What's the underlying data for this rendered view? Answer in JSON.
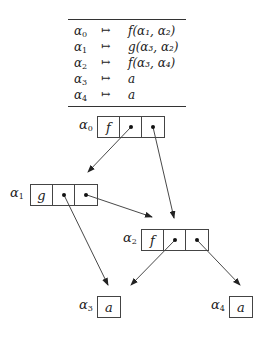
{
  "table": {
    "rows": [
      {
        "lhs": "α",
        "lhs_sub": "0",
        "arrow": "↦",
        "rhs": "f(α₁, α₂)"
      },
      {
        "lhs": "α",
        "lhs_sub": "1",
        "arrow": "↦",
        "rhs": "g(α₃, α₂)"
      },
      {
        "lhs": "α",
        "lhs_sub": "2",
        "arrow": "↦",
        "rhs": "f(α₃, α₄)"
      },
      {
        "lhs": "α",
        "lhs_sub": "3",
        "arrow": "↦",
        "rhs": "a"
      },
      {
        "lhs": "α",
        "lhs_sub": "4",
        "arrow": "↦",
        "rhs": "a"
      }
    ]
  },
  "nodes": {
    "n0": {
      "label": "α",
      "sub": "0",
      "symbol": "f"
    },
    "n1": {
      "label": "α",
      "sub": "1",
      "symbol": "g"
    },
    "n2": {
      "label": "α",
      "sub": "2",
      "symbol": "f"
    },
    "n3": {
      "label": "α",
      "sub": "3",
      "symbol": "a"
    },
    "n4": {
      "label": "α",
      "sub": "4",
      "symbol": "a"
    }
  },
  "edges": [
    {
      "from": "α0.arg1",
      "to": "α1"
    },
    {
      "from": "α0.arg2",
      "to": "α2"
    },
    {
      "from": "α1.arg1",
      "to": "α3"
    },
    {
      "from": "α1.arg2",
      "to": "α2"
    },
    {
      "from": "α2.arg1",
      "to": "α3"
    },
    {
      "from": "α2.arg2",
      "to": "α4"
    }
  ]
}
